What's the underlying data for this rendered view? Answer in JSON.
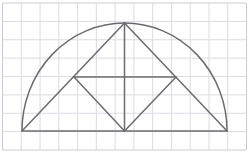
{
  "canvas": {
    "width": 249,
    "height": 155,
    "background": "#ffffff",
    "title": "Semicircle with inscribed triangles on graph paper"
  },
  "grid": {
    "name": "graph-paper-grid",
    "line_color": "#d9dce1",
    "border_color": "#c8ccd2",
    "line_width": 1,
    "cell_width": 18.77,
    "cell_height": 18.38,
    "columns": 13,
    "rows": 8,
    "origin_x": 2.5,
    "origin_y": 3.0,
    "right_edge": 246.5,
    "bottom_edge": 150.0
  },
  "figure": {
    "stroke_color": "#6f6a70",
    "stroke_width": 1.5,
    "fill": "none",
    "arc": {
      "name": "semicircle-arc",
      "type": "semicircular-arc",
      "center_x": 124.5,
      "center_y": 131.0,
      "radius_x": 102.5,
      "radius_y": 108.0,
      "start_x": 22.0,
      "start_y": 131.0,
      "end_x": 227.0,
      "end_y": 131.0,
      "apex_x": 124.5,
      "apex_y": 23.0
    },
    "points": {
      "left_base": {
        "name": "left-base-vertex",
        "x": 22.0,
        "y": 131.0
      },
      "right_base": {
        "name": "right-base-vertex",
        "x": 227.0,
        "y": 131.0
      },
      "bottom_center": {
        "name": "bottom-center-vertex",
        "x": 124.5,
        "y": 131.0
      },
      "apex": {
        "name": "apex-vertex",
        "x": 124.5,
        "y": 23.0
      },
      "left_mid": {
        "name": "left-chord-vertex",
        "x": 74.0,
        "y": 77.0
      },
      "right_mid": {
        "name": "right-chord-vertex",
        "x": 176.0,
        "y": 77.0
      }
    },
    "segments": [
      {
        "name": "baseline-diameter",
        "x1": 22.0,
        "y1": 131.0,
        "x2": 227.0,
        "y2": 131.0
      },
      {
        "name": "mid-horizontal-chord",
        "x1": 74.0,
        "y1": 77.0,
        "x2": 176.0,
        "y2": 77.0
      },
      {
        "name": "vertical-axis",
        "x1": 124.5,
        "y1": 23.0,
        "x2": 124.5,
        "y2": 131.0
      },
      {
        "name": "left-base-to-apex",
        "x1": 22.0,
        "y1": 131.0,
        "x2": 124.5,
        "y2": 23.0
      },
      {
        "name": "right-base-to-apex",
        "x1": 227.0,
        "y1": 131.0,
        "x2": 124.5,
        "y2": 23.0
      },
      {
        "name": "left-mid-to-bottom-center",
        "x1": 74.0,
        "y1": 77.0,
        "x2": 124.5,
        "y2": 131.0
      },
      {
        "name": "right-mid-to-bottom-center",
        "x1": 176.0,
        "y1": 77.0,
        "x2": 124.5,
        "y2": 131.0
      }
    ]
  }
}
